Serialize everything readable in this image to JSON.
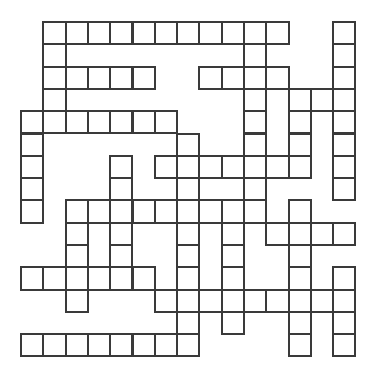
{
  "puzzle": {
    "type": "crossword-grid",
    "rows": 15,
    "cols": 15,
    "cell_size_px": 22.3,
    "line_color": "#3a3a3a",
    "background": "#ffffff",
    "white_cells": [
      [
        0,
        1
      ],
      [
        0,
        2
      ],
      [
        0,
        3
      ],
      [
        0,
        4
      ],
      [
        0,
        5
      ],
      [
        0,
        6
      ],
      [
        0,
        7
      ],
      [
        0,
        8
      ],
      [
        0,
        9
      ],
      [
        0,
        10
      ],
      [
        0,
        11
      ],
      [
        0,
        14
      ],
      [
        1,
        1
      ],
      [
        1,
        10
      ],
      [
        1,
        14
      ],
      [
        2,
        1
      ],
      [
        2,
        2
      ],
      [
        2,
        3
      ],
      [
        2,
        4
      ],
      [
        2,
        5
      ],
      [
        2,
        8
      ],
      [
        2,
        9
      ],
      [
        2,
        10
      ],
      [
        2,
        11
      ],
      [
        2,
        14
      ],
      [
        3,
        1
      ],
      [
        3,
        10
      ],
      [
        3,
        12
      ],
      [
        3,
        13
      ],
      [
        3,
        14
      ],
      [
        4,
        0
      ],
      [
        4,
        1
      ],
      [
        4,
        2
      ],
      [
        4,
        3
      ],
      [
        4,
        4
      ],
      [
        4,
        5
      ],
      [
        4,
        6
      ],
      [
        4,
        10
      ],
      [
        4,
        12
      ],
      [
        4,
        14
      ],
      [
        5,
        0
      ],
      [
        5,
        7
      ],
      [
        5,
        10
      ],
      [
        5,
        12
      ],
      [
        5,
        14
      ],
      [
        6,
        0
      ],
      [
        6,
        4
      ],
      [
        6,
        6
      ],
      [
        6,
        7
      ],
      [
        6,
        8
      ],
      [
        6,
        9
      ],
      [
        6,
        10
      ],
      [
        6,
        11
      ],
      [
        6,
        12
      ],
      [
        6,
        14
      ],
      [
        7,
        0
      ],
      [
        7,
        4
      ],
      [
        7,
        7
      ],
      [
        7,
        10
      ],
      [
        7,
        14
      ],
      [
        8,
        0
      ],
      [
        8,
        2
      ],
      [
        8,
        3
      ],
      [
        8,
        4
      ],
      [
        8,
        5
      ],
      [
        8,
        6
      ],
      [
        8,
        7
      ],
      [
        8,
        8
      ],
      [
        8,
        9
      ],
      [
        8,
        10
      ],
      [
        8,
        12
      ],
      [
        9,
        2
      ],
      [
        9,
        4
      ],
      [
        9,
        7
      ],
      [
        9,
        9
      ],
      [
        9,
        11
      ],
      [
        9,
        12
      ],
      [
        9,
        13
      ],
      [
        9,
        14
      ],
      [
        10,
        2
      ],
      [
        10,
        4
      ],
      [
        10,
        7
      ],
      [
        10,
        9
      ],
      [
        10,
        12
      ],
      [
        11,
        0
      ],
      [
        11,
        1
      ],
      [
        11,
        2
      ],
      [
        11,
        3
      ],
      [
        11,
        4
      ],
      [
        11,
        5
      ],
      [
        11,
        7
      ],
      [
        11,
        9
      ],
      [
        11,
        12
      ],
      [
        11,
        14
      ],
      [
        12,
        2
      ],
      [
        12,
        6
      ],
      [
        12,
        7
      ],
      [
        12,
        8
      ],
      [
        12,
        9
      ],
      [
        12,
        10
      ],
      [
        12,
        11
      ],
      [
        12,
        12
      ],
      [
        12,
        13
      ],
      [
        12,
        14
      ],
      [
        13,
        7
      ],
      [
        13,
        9
      ],
      [
        13,
        12
      ],
      [
        13,
        14
      ],
      [
        14,
        0
      ],
      [
        14,
        1
      ],
      [
        14,
        2
      ],
      [
        14,
        3
      ],
      [
        14,
        4
      ],
      [
        14,
        5
      ],
      [
        14,
        6
      ],
      [
        14,
        7
      ],
      [
        14,
        12
      ],
      [
        14,
        14
      ]
    ]
  }
}
